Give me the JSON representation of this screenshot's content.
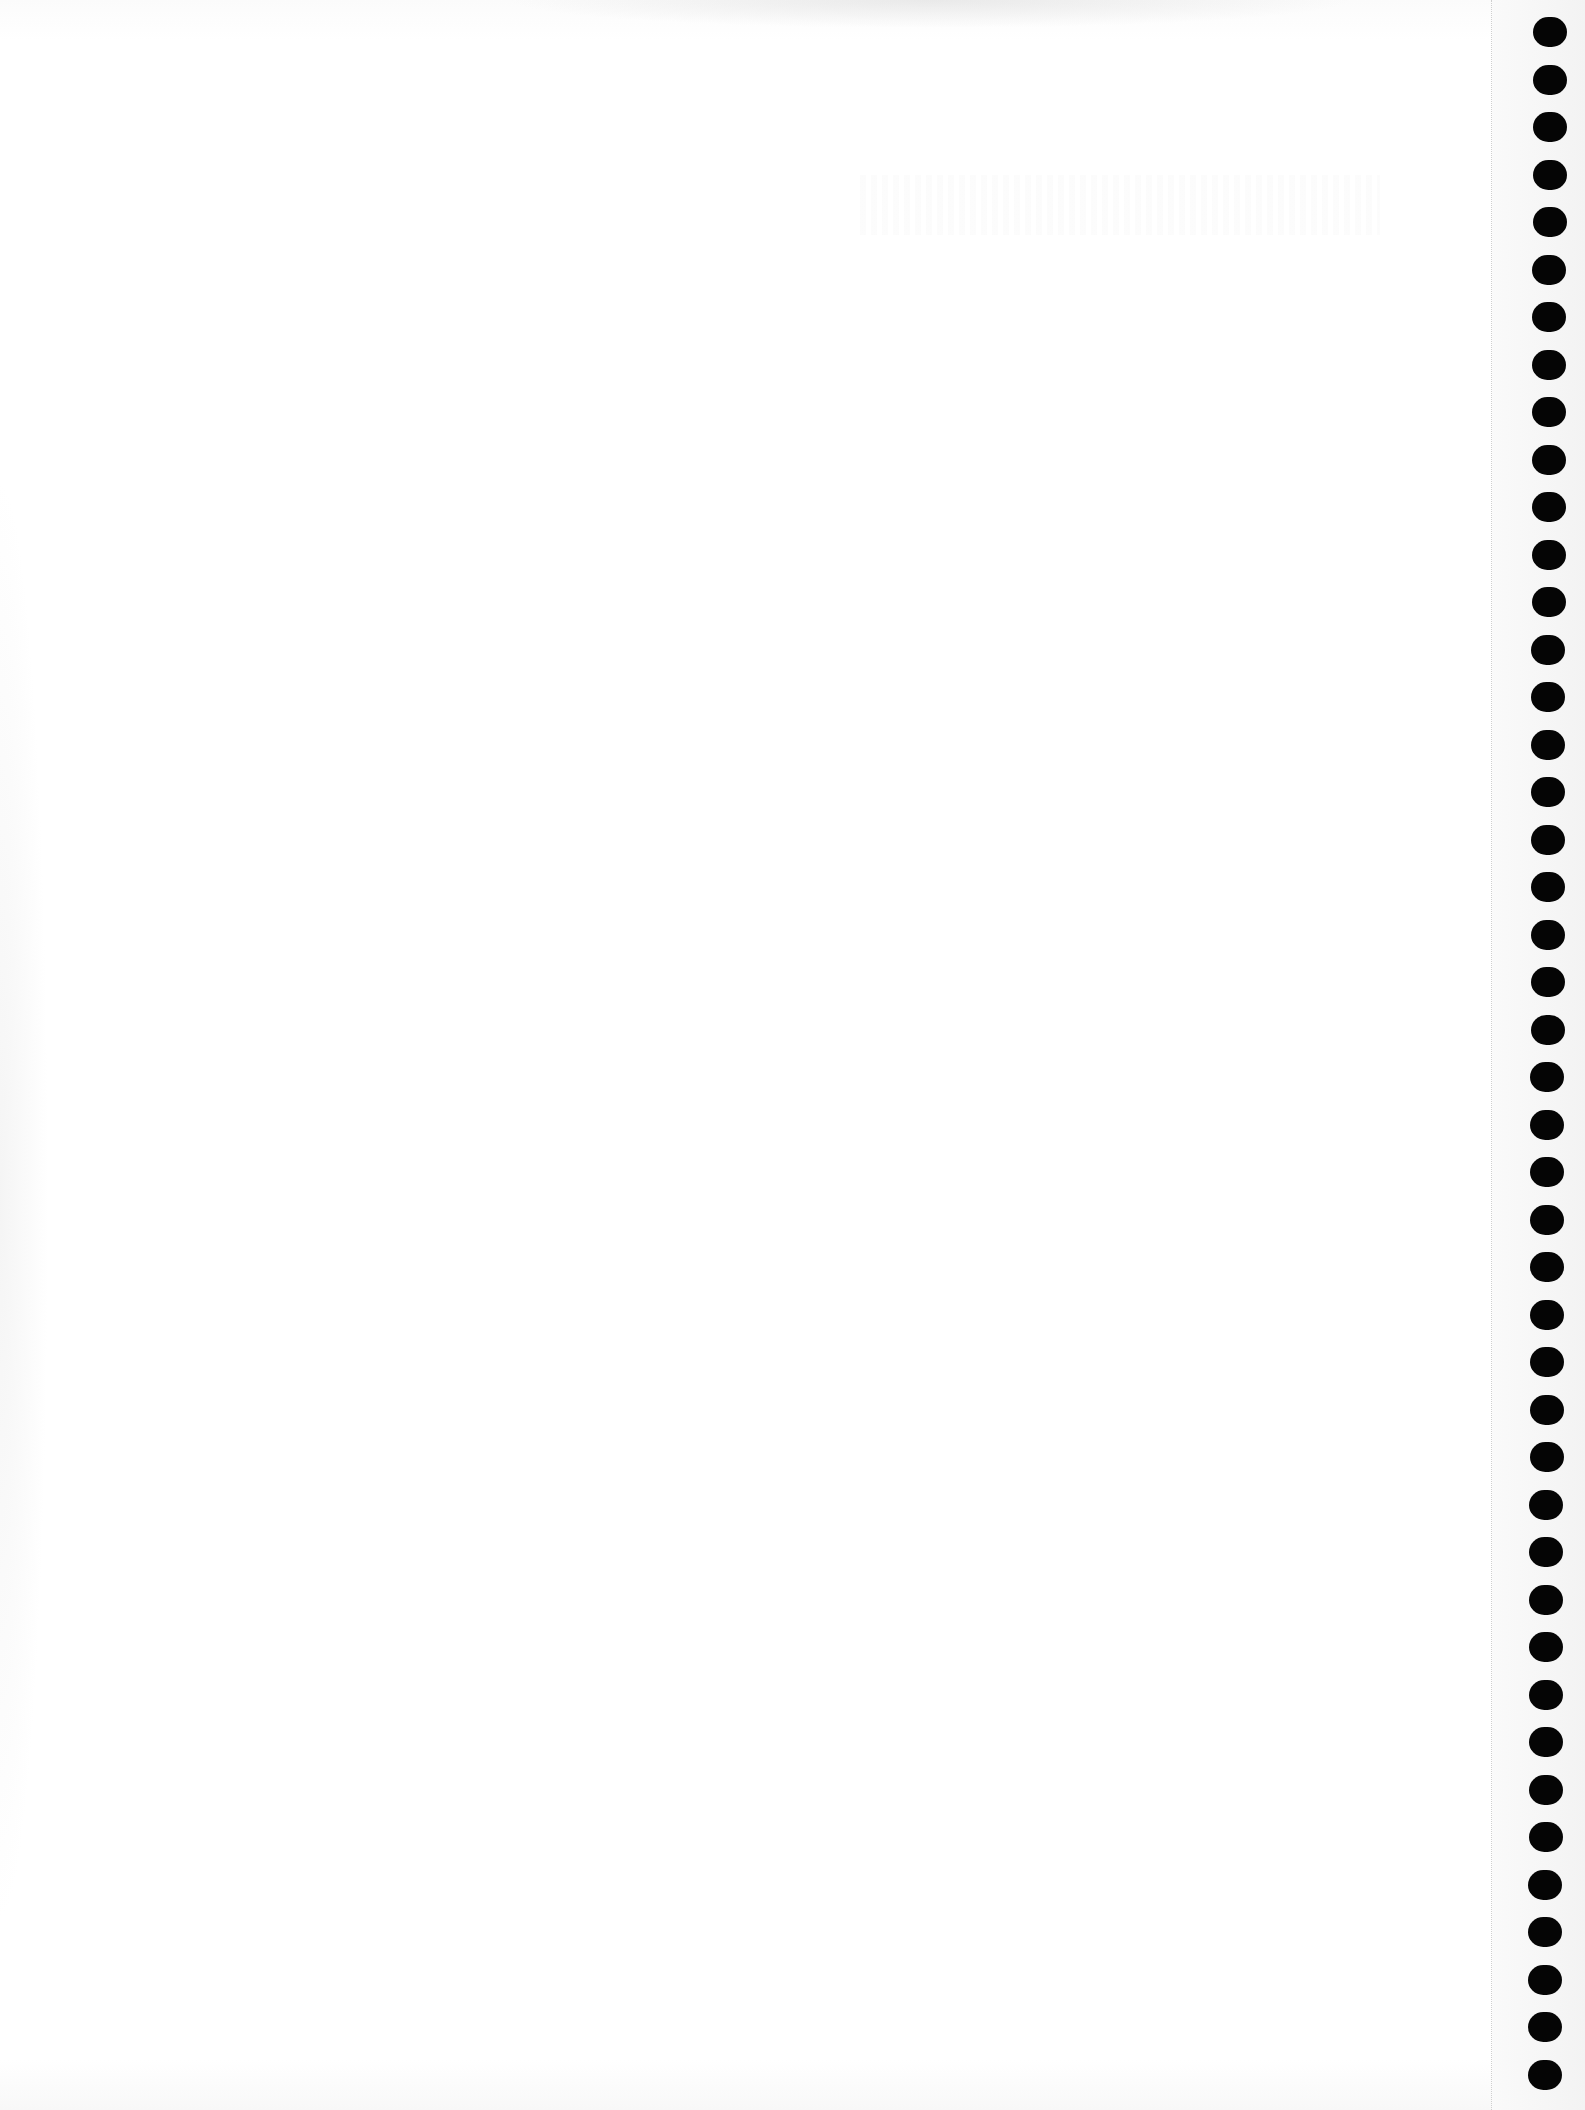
{
  "document": {
    "type": "blank notebook page",
    "paper_color": "#ffffff",
    "hole_color": "#050505",
    "perforation_color": "#cfcfcf"
  },
  "binding": {
    "side": "right",
    "hole_count": 44,
    "first_hole_top": 17,
    "hole_spacing": 47.5,
    "hole_left_start": 1533,
    "hole_left_end": 1528
  }
}
